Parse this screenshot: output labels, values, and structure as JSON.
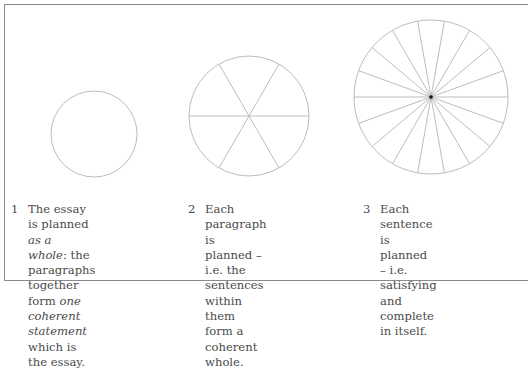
{
  "diagram": {
    "stroke_color": "#bdbdbd",
    "center_dot_color": "#111111",
    "circles": [
      {
        "id": 1,
        "cx": 94,
        "cy": 134,
        "r": 43,
        "spokes": 0
      },
      {
        "id": 2,
        "cx": 249,
        "cy": 116,
        "r": 60,
        "spokes": 6
      },
      {
        "id": 3,
        "cx": 431,
        "cy": 97,
        "r": 77,
        "spokes": 18
      }
    ]
  },
  "captions": [
    {
      "number": "1",
      "parts": [
        {
          "t": "The essay is planned "
        },
        {
          "t": "as a",
          "i": true
        },
        {
          "br": true
        },
        {
          "t": "whole",
          "i": true
        },
        {
          "t": ": the paragraphs"
        },
        {
          "br": true
        },
        {
          "t": "together form "
        },
        {
          "t": "one",
          "i": true
        },
        {
          "br": true
        },
        {
          "t": "coherent statement",
          "i": true
        },
        {
          "br": true
        },
        {
          "t": "which is the essay."
        }
      ]
    },
    {
      "number": "2",
      "parts": [
        {
          "t": "Each paragraph is"
        },
        {
          "br": true
        },
        {
          "t": "planned – i.e. the"
        },
        {
          "br": true
        },
        {
          "t": "sentences within them"
        },
        {
          "br": true
        },
        {
          "t": "form a coherent whole."
        }
      ]
    },
    {
      "number": "3",
      "parts": [
        {
          "t": "Each sentence is"
        },
        {
          "br": true
        },
        {
          "t": "planned – i.e. satisfying"
        },
        {
          "br": true
        },
        {
          "t": "and complete in itself."
        }
      ]
    }
  ]
}
